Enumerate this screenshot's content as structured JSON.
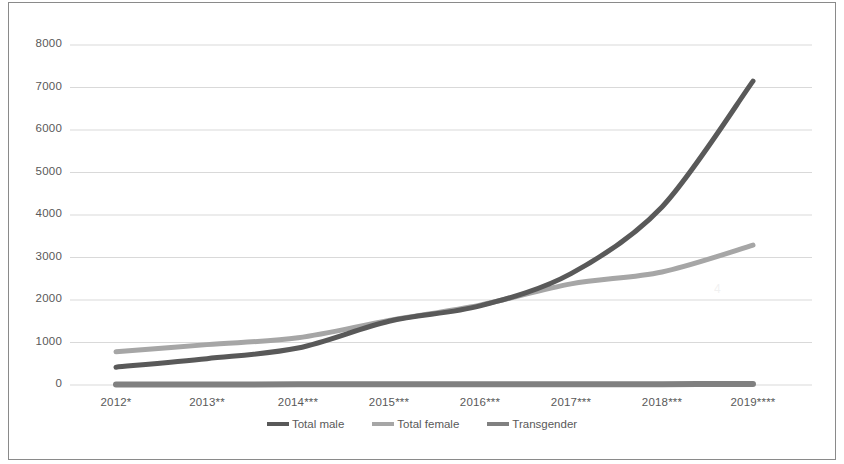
{
  "figure": {
    "border_color": "#8a8a8a",
    "background": "#ffffff"
  },
  "chart_data": {
    "type": "line",
    "title": "",
    "subtitle": "",
    "xlabel": "",
    "ylabel": "",
    "categories": [
      "2012*",
      "2013**",
      "2014***",
      "2015***",
      "2016***",
      "2017***",
      "2018***",
      "2019****"
    ],
    "ylim": [
      0,
      8000
    ],
    "ytick_values": [
      0,
      1000,
      2000,
      3000,
      4000,
      5000,
      6000,
      7000,
      8000
    ],
    "ytick_labels": [
      "0",
      "1000",
      "2000",
      "3000",
      "4000",
      "5000",
      "6000",
      "7000",
      "8000"
    ],
    "grid": "horizontal",
    "legend_position": "bottom-center",
    "series": [
      {
        "name": "Total male",
        "color": "#595959",
        "values": [
          420,
          620,
          870,
          1500,
          1860,
          2620,
          4190,
          7150
        ]
      },
      {
        "name": "Total female",
        "color": "#a6a6a6",
        "values": [
          780,
          950,
          1110,
          1520,
          1880,
          2380,
          2660,
          3290
        ]
      },
      {
        "name": "Transgender",
        "color": "#808080",
        "values": [
          10,
          10,
          15,
          15,
          20,
          20,
          20,
          25
        ]
      }
    ]
  },
  "legend": {
    "items": [
      {
        "label": "Total male",
        "color": "#595959"
      },
      {
        "label": "Total female",
        "color": "#a6a6a6"
      },
      {
        "label": "Transgender",
        "color": "#808080"
      }
    ]
  }
}
